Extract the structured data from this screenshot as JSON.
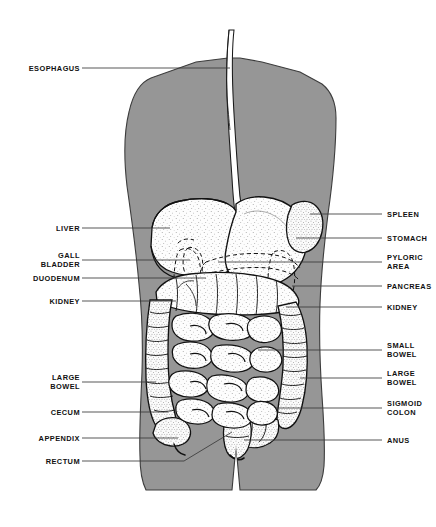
{
  "figure": {
    "background_color": "#ffffff",
    "body_fill_color": "#969696",
    "organ_fill_color": "#fdfdfd",
    "outline_color": "#111111",
    "leader_line_color": "#3a3a3a"
  },
  "labels_left": [
    {
      "id": "esophagus",
      "text": "ESOPHAGUS",
      "lines": [
        "ESOPHAGUS"
      ]
    },
    {
      "id": "liver",
      "text": "LIVER",
      "lines": [
        "LIVER"
      ]
    },
    {
      "id": "gall-bladder",
      "text": "GALL BLADDER",
      "lines": [
        "GALL",
        "BLADDER"
      ]
    },
    {
      "id": "duodenum",
      "text": "DUODENUM",
      "lines": [
        "DUODENUM"
      ]
    },
    {
      "id": "kidney-left",
      "text": "KIDNEY",
      "lines": [
        "KIDNEY"
      ]
    },
    {
      "id": "large-bowel-left",
      "text": "LARGE BOWEL",
      "lines": [
        "LARGE",
        "BOWEL"
      ]
    },
    {
      "id": "cecum",
      "text": "CECUM",
      "lines": [
        "CECUM"
      ]
    },
    {
      "id": "appendix",
      "text": "APPENDIX",
      "lines": [
        "APPENDIX"
      ]
    },
    {
      "id": "rectum",
      "text": "RECTUM",
      "lines": [
        "RECTUM"
      ]
    }
  ],
  "labels_right": [
    {
      "id": "spleen",
      "text": "SPLEEN",
      "lines": [
        "SPLEEN"
      ]
    },
    {
      "id": "stomach",
      "text": "STOMACH",
      "lines": [
        "STOMACH"
      ]
    },
    {
      "id": "pyloric-area",
      "text": "PYLORIC AREA",
      "lines": [
        "PYLORIC",
        "AREA"
      ]
    },
    {
      "id": "pancreas",
      "text": "PANCREAS",
      "lines": [
        "PANCREAS"
      ]
    },
    {
      "id": "kidney-right",
      "text": "KIDNEY",
      "lines": [
        "KIDNEY"
      ]
    },
    {
      "id": "small-bowel",
      "text": "SMALL BOWEL",
      "lines": [
        "SMALL",
        "BOWEL"
      ]
    },
    {
      "id": "large-bowel-right",
      "text": "LARGE BOWEL",
      "lines": [
        "LARGE",
        "BOWEL"
      ]
    },
    {
      "id": "sigmoid-colon",
      "text": "SIGMOID COLON",
      "lines": [
        "SIGMOID",
        "COLON"
      ]
    },
    {
      "id": "anus",
      "text": "ANUS",
      "lines": [
        "ANUS"
      ]
    }
  ],
  "label_text": {
    "esophagus": "ESOPHAGUS",
    "liver": "LIVER",
    "gall_1": "GALL",
    "gall_2": "BLADDER",
    "duodenum": "DUODENUM",
    "kidney_left": "KIDNEY",
    "large_bowel_left_1": "LARGE",
    "large_bowel_left_2": "BOWEL",
    "cecum": "CECUM",
    "appendix": "APPENDIX",
    "rectum": "RECTUM",
    "spleen": "SPLEEN",
    "stomach": "STOMACH",
    "pyloric_1": "PYLORIC",
    "pyloric_2": "AREA",
    "pancreas": "PANCREAS",
    "kidney_right": "KIDNEY",
    "small_bowel_1": "SMALL",
    "small_bowel_2": "BOWEL",
    "large_bowel_right_1": "LARGE",
    "large_bowel_right_2": "BOWEL",
    "sigmoid_1": "SIGMOID",
    "sigmoid_2": "COLON",
    "anus": "ANUS"
  }
}
